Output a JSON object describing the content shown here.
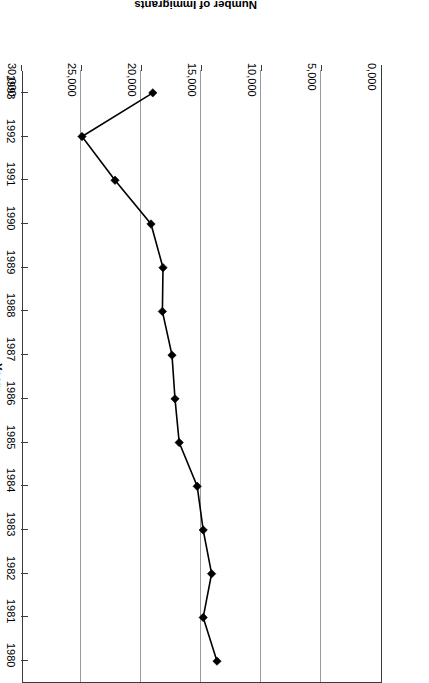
{
  "chart_data": {
    "type": "line",
    "title": "",
    "xlabel": "Year",
    "ylabel": "Number of Immigrants",
    "orientation": "rotated-180",
    "grid": true,
    "legend": "none",
    "categories": [
      "1980",
      "1981",
      "1982",
      "1983",
      "1984",
      "1985",
      "1986",
      "1987",
      "1988",
      "1989",
      "1990",
      "1991",
      "1992",
      "1993"
    ],
    "values": [
      13750,
      14900,
      14200,
      14900,
      15400,
      16900,
      17250,
      17500,
      18300,
      18250,
      19250,
      22250,
      25000,
      19100
    ],
    "value_axis_ticks": [
      "0,000",
      "5,000",
      "10,000",
      "15,000",
      "20,000",
      "25,000",
      "30,000"
    ],
    "value_axis_tick_values": [
      0,
      5000,
      10000,
      15000,
      20000,
      25000,
      30000
    ],
    "ylim": [
      0,
      30000
    ],
    "series": [
      {
        "name": "Number of Immigrants",
        "values": [
          13750,
          14900,
          14200,
          14900,
          15400,
          16900,
          17250,
          17500,
          18300,
          18250,
          19250,
          22250,
          25000,
          19100
        ]
      }
    ],
    "marker": "diamond",
    "line_color": "#000000",
    "grid_color": "#9a9a9a",
    "axis_color": "#3a3a3a"
  }
}
